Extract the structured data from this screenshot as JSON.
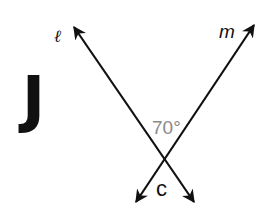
{
  "problem": {
    "letter": "J"
  },
  "diagram": {
    "lines": [
      {
        "name": "ℓ",
        "from": [
          196,
          205
        ],
        "to": [
          72,
          24
        ]
      },
      {
        "name": "m",
        "from": [
          134,
          205
        ],
        "to": [
          256,
          22
        ]
      }
    ],
    "intersection": [
      165,
      157
    ],
    "angle_label": "70°",
    "angle_label_color": "#8a8a8a",
    "angle_variable": "c",
    "line_color": "#111111"
  }
}
